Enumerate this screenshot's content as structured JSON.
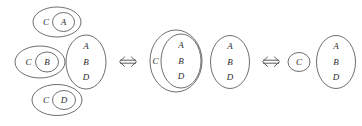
{
  "diagram": {
    "type": "set-equivalence-diagram",
    "stroke_color": "#4a4a4a",
    "text_color": "#2b2b2b",
    "background": "#ffffff",
    "relation_symbol": "⟺",
    "stages": [
      {
        "name": "stage-left",
        "groups": [
          {
            "name": "group-ca",
            "outer_label": "C",
            "inner_labels": [
              "A"
            ]
          },
          {
            "name": "group-cb",
            "outer_label": "C",
            "inner_labels": [
              "B"
            ]
          },
          {
            "name": "group-abd",
            "outer_label": "",
            "inner_labels": [
              "A",
              "B",
              "D"
            ]
          },
          {
            "name": "group-cd",
            "outer_label": "C",
            "inner_labels": [
              "D"
            ]
          }
        ]
      },
      {
        "name": "stage-middle",
        "groups": [
          {
            "name": "group-c-abd",
            "outer_label": "C",
            "inner_labels": [
              "A",
              "B",
              "D"
            ]
          },
          {
            "name": "group-abd",
            "outer_label": "",
            "inner_labels": [
              "A",
              "B",
              "D"
            ]
          }
        ]
      },
      {
        "name": "stage-right",
        "groups": [
          {
            "name": "group-c",
            "outer_label": "",
            "inner_labels": [
              "C"
            ]
          },
          {
            "name": "group-abd",
            "outer_label": "",
            "inner_labels": [
              "A",
              "B",
              "D"
            ]
          }
        ]
      }
    ],
    "labels": {
      "A": "A",
      "B": "B",
      "C": "C",
      "D": "D"
    }
  }
}
